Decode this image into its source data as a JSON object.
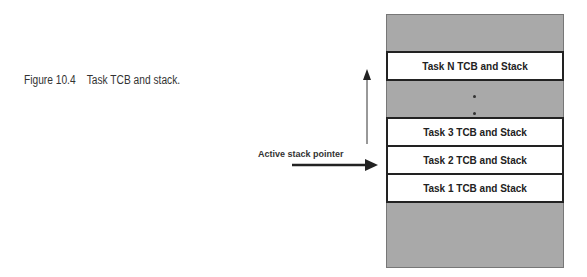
{
  "caption": "Figure 10.4    Task TCB and stack.",
  "diagram": {
    "tasks": [
      {
        "label": "Task N TCB and Stack"
      },
      {
        "label": "Task 3 TCB and Stack"
      },
      {
        "label": "Task 2 TCB and Stack"
      },
      {
        "label": "Task 1 TCB and Stack"
      }
    ],
    "pointer_label": "Active stack pointer",
    "colors": {
      "stack_fill": "#a9a9a9",
      "task_fill": "#ffffff",
      "border": "#222222"
    }
  }
}
